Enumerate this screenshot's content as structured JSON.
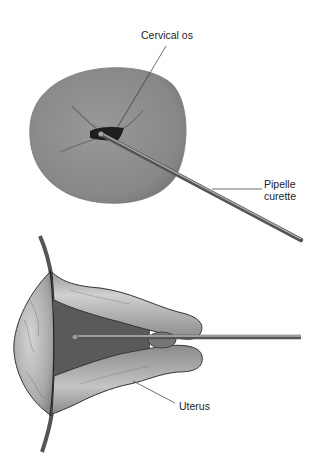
{
  "figure": {
    "top_view": {
      "structure": "cervix-face",
      "labels": {
        "cervical_os": "Cervical os",
        "pipelle_line1": "Pipelle",
        "pipelle_line2": "curette"
      }
    },
    "bottom_view": {
      "structure": "uterus-cross-section",
      "labels": {
        "uterus": "Uterus"
      }
    }
  },
  "colors": {
    "cervix_fill": "#8c8c8c",
    "os_dark": "#1e1e1e",
    "rod": "#6a6a6a",
    "rod_highlight": "#b8b8b8",
    "uterus_light": "#c8c8c8",
    "uterus_mid": "#9a9a9a",
    "cavity": "#5a5a5a",
    "leader_line": "#333333"
  }
}
